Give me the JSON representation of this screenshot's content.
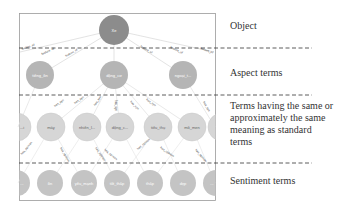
{
  "labels": {
    "object": "Object",
    "aspect": "Aspect terms",
    "synonyms": "Terms having the same or approximately the same meaning as standard terms",
    "synonyms_lines": [
      "Terms having the same or",
      "approximately the same",
      "meaning as standard",
      "terms"
    ],
    "sentiment": "Sentiment terms"
  },
  "graph": {
    "object_node": {
      "label": "Xe",
      "color": "#8c8c8c"
    },
    "aspect_nodes": [
      {
        "label": "tiếng_ồn"
      },
      {
        "label": "động_cơ"
      },
      {
        "label": "ngoại_t..."
      }
    ],
    "synonym_nodes": [
      {
        "label": "...i"
      },
      {
        "label": "máy"
      },
      {
        "label": "nhiên_l..."
      },
      {
        "label": "động_c..."
      },
      {
        "label": "tiêu_thụ"
      },
      {
        "label": "mô_men"
      },
      {
        "label": ""
      }
    ],
    "sentiment_nodes": [
      {
        "label": "..."
      },
      {
        "label": "ồn"
      },
      {
        "label": "yếu_mạnh"
      },
      {
        "label": "tốt_thấp"
      },
      {
        "label": "thấp"
      },
      {
        "label": "đẹp"
      },
      {
        "label": "..."
      }
    ],
    "edge_labels": {
      "object_to_aspect": "feature_of",
      "aspect_to_synonym": "has_syn",
      "synonym_to_sentiment": "has_opinion"
    },
    "colors": {
      "object": "#8c8c8c",
      "aspect": "#b5b5b5",
      "synonym": "#d4d4d4",
      "sentiment": "#c2c2c2",
      "edge": "#dddddd",
      "divider": "#333333",
      "frame": "#999999"
    }
  }
}
